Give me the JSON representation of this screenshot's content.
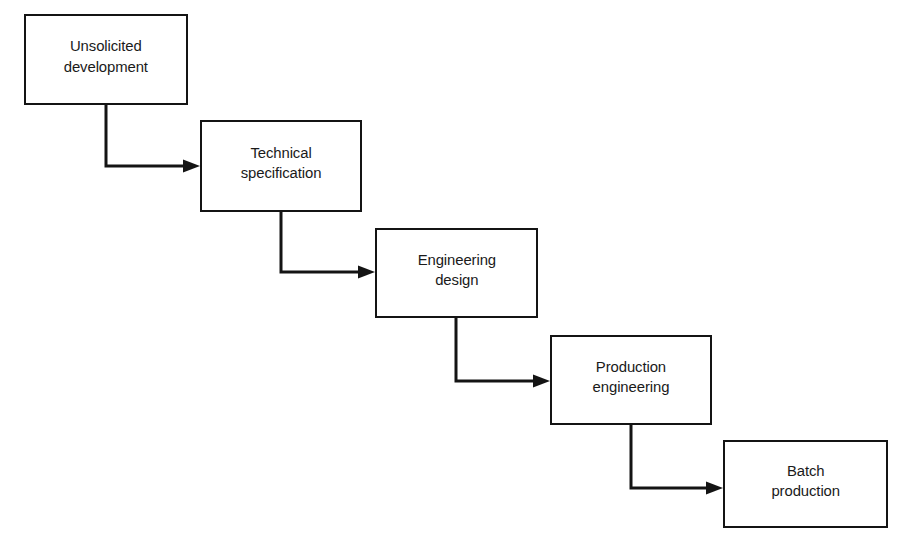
{
  "diagram": {
    "background_color": "#ffffff",
    "line_color": "#141414",
    "text_color": "#1a1a1a",
    "nodes": [
      {
        "id": "unsolicited-development",
        "label": "Unsolicited\ndevelopment",
        "x": 24,
        "y": 14,
        "w": 164,
        "h": 91
      },
      {
        "id": "technical-specification",
        "label": "Technical\nspecification",
        "x": 200,
        "y": 120,
        "w": 162,
        "h": 92
      },
      {
        "id": "engineering-design",
        "label": "Engineering\ndesign",
        "x": 375,
        "y": 228,
        "w": 163,
        "h": 90
      },
      {
        "id": "production-engineering",
        "label": "Production\nengineering",
        "x": 550,
        "y": 335,
        "w": 162,
        "h": 90
      },
      {
        "id": "batch-production",
        "label": "Batch\nproduction",
        "x": 723,
        "y": 440,
        "w": 165,
        "h": 88
      }
    ],
    "connectors": [
      {
        "id": "connector-1",
        "from": "unsolicited-development",
        "to": "technical-specification",
        "path": "M 106 105 L 106 166 L 194 166",
        "arrow_at": {
          "x": 200,
          "y": 166
        }
      },
      {
        "id": "connector-2",
        "from": "technical-specification",
        "to": "engineering-design",
        "path": "M 281 212 L 281 272 L 369 272",
        "arrow_at": {
          "x": 375,
          "y": 272
        }
      },
      {
        "id": "connector-3",
        "from": "engineering-design",
        "to": "production-engineering",
        "path": "M 456 318 L 456 381 L 544 381",
        "arrow_at": {
          "x": 550,
          "y": 381
        }
      },
      {
        "id": "connector-4",
        "from": "production-engineering",
        "to": "batch-production",
        "path": "M 631 425 L 631 488 L 717 488",
        "arrow_at": {
          "x": 723,
          "y": 488
        }
      }
    ]
  }
}
